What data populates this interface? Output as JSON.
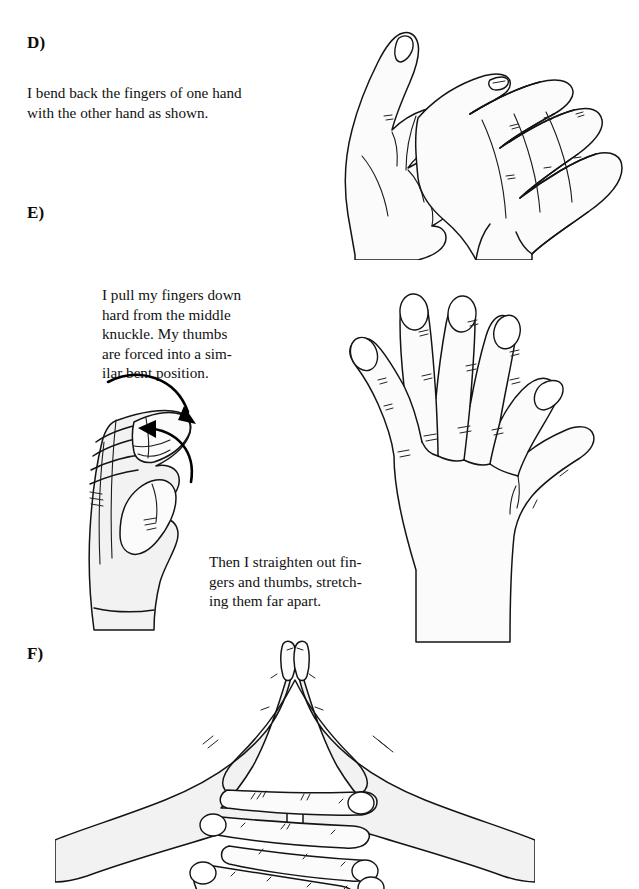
{
  "page": {
    "background_color": "#ffffff",
    "ink_color": "#141414",
    "skin_fill_color": "#fbfbfb",
    "width": 639,
    "height": 889
  },
  "sections": [
    {
      "id": "d",
      "label": "D)",
      "text": "I bend back the fingers of one hand\nwith the other hand as shown.",
      "illustration_name": "two-hands-bending-fingers-back"
    },
    {
      "id": "e",
      "label": "E)",
      "text": "I pull my fingers down\nhard from  the middle\nknuckle.    My thumbs\nare forced into a  sim-\nilar bent position.",
      "text_secondary": "Then I straighten out fin-\ngers and thumbs, stretch-\ning them far apart.",
      "illustration_name_left": "hand-with-bent-fingers-and-arrows",
      "illustration_name_right": "open-hand-fingers-spread"
    },
    {
      "id": "f",
      "label": "F)",
      "illustration_name": "two-hands-interlocked-fingers"
    }
  ],
  "annotations": {
    "arrow_top": "curved-arrow-down-right",
    "arrow_bottom": "curved-arrow-up-left"
  }
}
